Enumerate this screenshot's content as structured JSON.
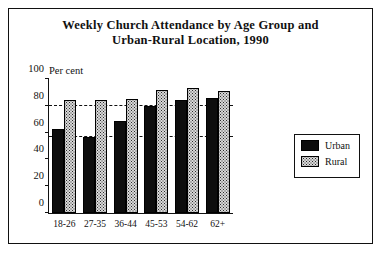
{
  "chart_data": {
    "type": "bar",
    "title": "Weekly Church Attendance by Age Group and Urban-Rural Location, 1990",
    "title_line1": "Weekly Church Attendance by Age Group and",
    "title_line2": "Urban-Rural Location, 1990",
    "xlabel": "",
    "ylabel": "Per cent",
    "ylim": [
      0,
      100
    ],
    "yticks": [
      0,
      20,
      40,
      60,
      80,
      100
    ],
    "ytick_labels": [
      "0",
      "20",
      "40",
      "60",
      "80",
      "100"
    ],
    "gridlines": [
      57,
      80
    ],
    "grid": "dashed-horizontal",
    "legend_position": "right",
    "categories": [
      "18-26",
      "27-35",
      "36-44",
      "45-53",
      "54-62",
      "62+"
    ],
    "series": [
      {
        "name": "Urban",
        "color": "#0d0d0d",
        "pattern": "solid",
        "values": [
          63,
          57,
          69,
          80,
          84,
          86
        ]
      },
      {
        "name": "Rural",
        "color": "#d8d8d8",
        "pattern": "dotted",
        "values": [
          84,
          84,
          85,
          92,
          93,
          91
        ]
      }
    ]
  },
  "legend": {
    "items": [
      {
        "label": "Urban",
        "pattern": "solid"
      },
      {
        "label": "Rural",
        "pattern": "dotted"
      }
    ]
  }
}
